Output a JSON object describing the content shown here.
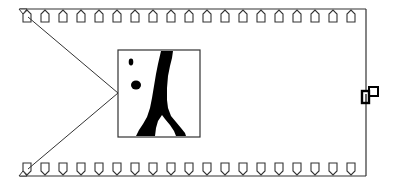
{
  "diagram": {
    "type": "schematic",
    "description": "Film-strip style strip with sprocket teeth on top and bottom edges, a magnified inset image connected by two converging lines to the left edge, and a small connector/tab icon on the right edge",
    "colors": {
      "background": "#ffffff",
      "stroke": "#333333",
      "fill_dark": "#000000"
    },
    "strip": {
      "left": 22,
      "right": 366,
      "top_edge_y": 9,
      "bottom_edge_y": 175,
      "teeth_count_top": 19,
      "teeth_count_bottom": 19,
      "teeth_start_x": 27,
      "teeth_spacing": 18
    },
    "inset": {
      "x": 118,
      "y": 50,
      "width": 82,
      "height": 87,
      "label": "magnified-inset"
    },
    "connector_icon": {
      "x": 362,
      "y": 86,
      "label": "tab-connector"
    }
  }
}
